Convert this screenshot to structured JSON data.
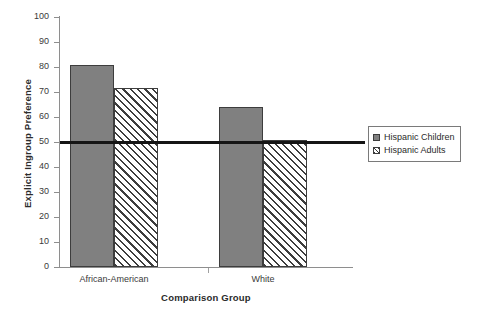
{
  "chart_data": {
    "type": "bar",
    "title": "",
    "xlabel": "Comparison Group",
    "ylabel": "Explicit Ingroup Preference",
    "categories": [
      "African-American",
      "White"
    ],
    "series": [
      {
        "name": "Hispanic Children",
        "values": [
          81,
          64
        ],
        "style": "solid-gray",
        "color": "#808080"
      },
      {
        "name": "Hispanic Adults",
        "values": [
          71.5,
          51
        ],
        "style": "diagonal-hatch",
        "color": "#ffffff"
      }
    ],
    "ylim": [
      0,
      100
    ],
    "yticks": [
      0,
      10,
      20,
      30,
      40,
      50,
      60,
      70,
      80,
      90,
      100
    ],
    "ytick_labels": [
      "0",
      "10",
      "20",
      "30",
      "40",
      "50",
      "60",
      "70",
      "80",
      "90",
      "100"
    ],
    "grid": false,
    "legend_position": "right",
    "reference_line": {
      "value": 50,
      "color": "#151515",
      "width": 3
    },
    "annotations": []
  },
  "legend": {
    "items": [
      {
        "label": "Hispanic Children",
        "swatch": "solid-swatch"
      },
      {
        "label": "Hispanic Adults",
        "swatch": "hatched-swatch"
      }
    ]
  },
  "axes": {
    "y_title": "Explicit Ingroup Preference",
    "x_title": "Comparison Group"
  }
}
